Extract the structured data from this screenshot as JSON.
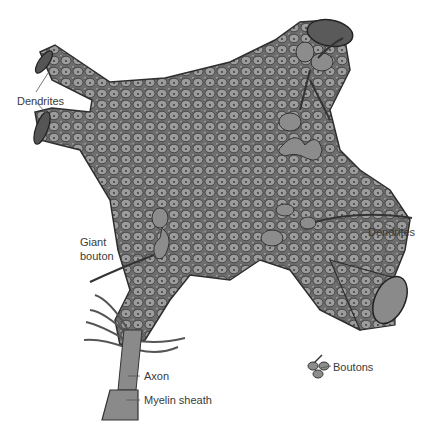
{
  "figure": {
    "colors": {
      "background": "#ffffff",
      "body_fill": "#7a7a7a",
      "bouton_fill": "#9a9a9a",
      "outline": "#2e2e2e",
      "label_text": "#3a3a3a",
      "leader_line": "#555555"
    }
  },
  "labels": {
    "dendrites_top_left": "Dendrites",
    "giant_bouton_line1": "Giant",
    "giant_bouton_line2": "bouton",
    "dendrites_right": "Dendrites",
    "boutons": "Boutons",
    "axon": "Axon",
    "myelin_sheath": "Myelin sheath"
  }
}
